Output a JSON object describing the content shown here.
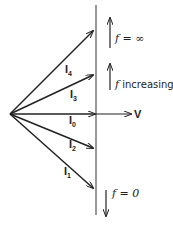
{
  "diagram": {
    "type": "phasor-diagram",
    "phasors": [
      {
        "name": "I",
        "sub": "4",
        "end": [
          93,
          31
        ]
      },
      {
        "name": "I",
        "sub": "3",
        "end": [
          93,
          75
        ]
      },
      {
        "name": "I",
        "sub": "0",
        "end": [
          93,
          114
        ]
      },
      {
        "name": "I",
        "sub": "2",
        "end": [
          93,
          148
        ]
      },
      {
        "name": "I",
        "sub": "1",
        "end": [
          93,
          188
        ]
      }
    ],
    "voltage": {
      "label": "V"
    },
    "annotations": {
      "f_infinity": "f = ∞",
      "f_increasing_prefix": "f",
      "f_increasing_text": " increasing",
      "f_zero": "f = 0"
    },
    "colors": {
      "stroke": "#222222"
    }
  }
}
